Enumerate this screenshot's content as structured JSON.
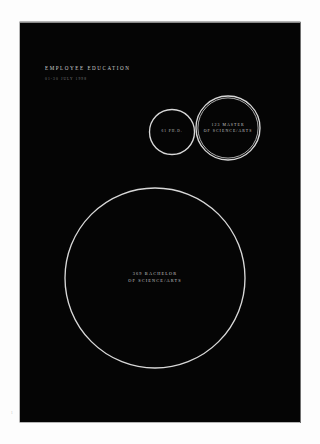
{
  "document": {
    "kind": "infographic-poster",
    "page_background": "#ffffff",
    "poster_background": "#050505",
    "stroke_color": "#d8d8d8",
    "text_color": "#cfcfcf"
  },
  "header": {
    "title": "EMPLOYEE EDUCATION",
    "subtitle": "01-30 JULY 1998"
  },
  "margin": {
    "page_number": "1"
  },
  "chart_data": {
    "type": "bubble",
    "title": "EMPLOYEE EDUCATION",
    "subtitle": "01-30 JULY 1998",
    "xlabel": "",
    "ylabel": "",
    "grid": false,
    "legend": "none",
    "encoding": "area-proportional circles, outline only",
    "categories": [
      "PH.D.",
      "MASTER OF SCIENCE/ARTS",
      "BACHELOR OF SCIENCE/ARTS"
    ],
    "values": [
      61,
      123,
      369
    ],
    "series": [
      {
        "name": "Employees by degree",
        "values": [
          61,
          123,
          369
        ]
      }
    ],
    "points": [
      {
        "id": "phd",
        "count": "61",
        "label_line_1": "61  PH.D.",
        "label_line_2": "",
        "value": 61,
        "cx": 152,
        "cy": 110,
        "r": 22.5,
        "rings": 1
      },
      {
        "id": "masters",
        "count": "123",
        "label_line_1": "123 MASTER",
        "label_line_2": "OF SCIENCE/ARTS",
        "value": 123,
        "cx": 208,
        "cy": 106,
        "r": 32,
        "rings": 2
      },
      {
        "id": "bachelors",
        "count": "369",
        "label_line_1": "369 BACHELOR",
        "label_line_2": "OF SCIENCE/ARTS",
        "value": 369,
        "cx": 135,
        "cy": 256,
        "r": 90,
        "rings": 1
      }
    ]
  }
}
